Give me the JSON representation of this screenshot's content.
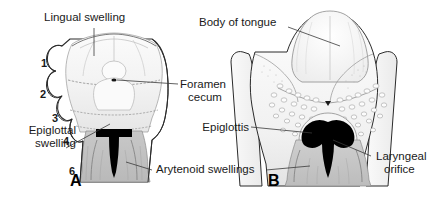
{
  "figure": {
    "domain_description": "Embryological development of the tongue, two-panel anatomical line drawing",
    "panels": [
      {
        "letter": "A",
        "name": "early-stage-tongue",
        "labels": [
          {
            "id": "lingual-swelling",
            "text": "Lingual swelling"
          },
          {
            "id": "epiglottal-swelling",
            "text": "Epiglottal\nswelling"
          },
          {
            "id": "foramen-cecum",
            "text": "Foramen\ncecum"
          },
          {
            "id": "arytenoid-swellings",
            "text": "Arytenoid swellings"
          }
        ],
        "arch_numbers": [
          "1",
          "2",
          "3",
          "4",
          "6"
        ]
      },
      {
        "letter": "B",
        "name": "later-stage-tongue",
        "labels": [
          {
            "id": "body-of-tongue",
            "text": "Body of tongue"
          },
          {
            "id": "epiglottis",
            "text": "Epiglottis"
          },
          {
            "id": "laryngeal-orifice",
            "text": "Laryngeal\norifice"
          }
        ]
      }
    ],
    "text": {
      "lingual_swelling": "Lingual swelling",
      "epiglottal_swelling_line1": "Epiglottal",
      "epiglottal_swelling_line2": "swelling",
      "foramen_cecum_line1": "Foramen",
      "foramen_cecum_line2": "cecum",
      "arytenoid_swellings": "Arytenoid swellings",
      "body_of_tongue": "Body of tongue",
      "epiglottis": "Epiglottis",
      "laryngeal_orifice_line1": "Laryngeal",
      "laryngeal_orifice_line2": "orifice",
      "panel_a_letter": "A",
      "panel_b_letter": "B",
      "arch_1": "1",
      "arch_2": "2",
      "arch_3": "3",
      "arch_4": "4",
      "arch_6": "6"
    },
    "colors": {
      "background": "#ffffff",
      "ink": "#1a1a1a",
      "outline": "#2b2b2b",
      "orifice_black": "#000000",
      "tissue_light": "#f7f7f7",
      "tissue_mid": "#e3e3e3",
      "tissue_shade": "#c9c9c9",
      "leader_line": "#3a3a3a"
    }
  }
}
